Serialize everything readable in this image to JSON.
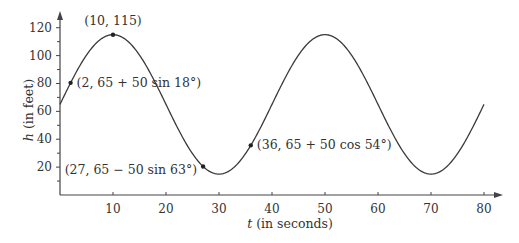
{
  "chart_data": {
    "type": "line",
    "title": "",
    "xlabel": "t (in seconds)",
    "xlabel_var": "t",
    "xlabel_rest": " (in seconds)",
    "ylabel": "h (in feet)",
    "ylabel_var": "h",
    "ylabel_rest": " (in feet)",
    "xlim": [
      0,
      80
    ],
    "ylim": [
      0,
      120
    ],
    "x_ticks": [
      10,
      20,
      30,
      40,
      50,
      60,
      70,
      80
    ],
    "y_ticks": [
      20,
      40,
      60,
      80,
      100,
      120
    ],
    "y_minor_ticks": [
      10,
      30,
      50,
      70,
      90,
      110
    ],
    "grid": false,
    "legend": null,
    "series": [
      {
        "name": "h(t) = 65 + 50 sin(πt/20)",
        "x": [
          0,
          5,
          10,
          15,
          20,
          25,
          30,
          35,
          40,
          45,
          50,
          55,
          60,
          65,
          70,
          75,
          80
        ],
        "values": [
          65,
          100.4,
          115,
          100.4,
          65,
          29.6,
          15,
          29.6,
          65,
          100.4,
          115,
          100.4,
          65,
          29.6,
          15,
          29.6,
          65
        ],
        "color": "#3a3a3a"
      }
    ],
    "annotations": [
      {
        "text": "(10, 115)",
        "x": 10,
        "y": 115
      },
      {
        "text": "(2, 65 + 50 sin 18°)",
        "x": 2,
        "y": 80.45
      },
      {
        "text": "(27, 65 − 50 sin 63°)",
        "x": 27,
        "y": 20.45
      },
      {
        "text": "(36, 65 + 50 cos 54°)",
        "x": 36,
        "y": 35.61
      }
    ]
  }
}
